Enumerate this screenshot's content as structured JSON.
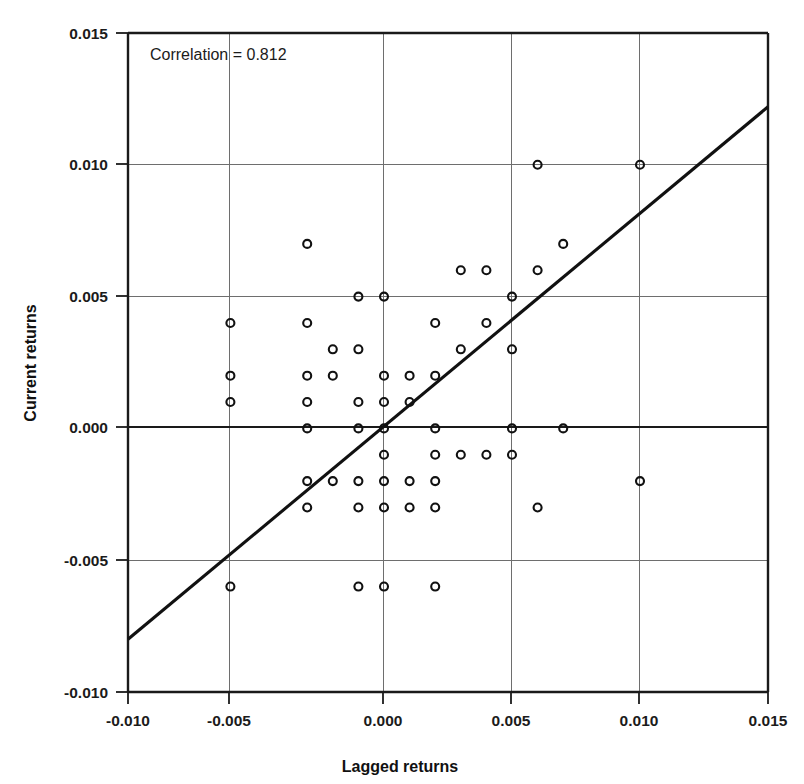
{
  "chart_data": {
    "type": "scatter",
    "title": "",
    "xlabel": "Lagged returns",
    "ylabel": "Current returns",
    "xlim": [
      -0.01,
      0.015
    ],
    "ylim": [
      -0.01,
      0.015
    ],
    "xticks": [
      "-0.010",
      "-0.005",
      "0.000",
      "0.005",
      "0.010",
      "0.015"
    ],
    "xtick_values": [
      -0.01,
      -0.005,
      0.0,
      0.005,
      0.01,
      0.015
    ],
    "yticks": [
      "-0.010",
      "-0.005",
      "0.000",
      "0.005",
      "0.010",
      "0.015"
    ],
    "ytick_values": [
      -0.01,
      -0.005,
      0.0,
      0.005,
      0.01,
      0.015
    ],
    "grid": true,
    "legend_position": "none",
    "annotations": [
      {
        "name": "correlation-label",
        "text": "Correlation = 0.812",
        "x": -0.0085,
        "y": 0.0139
      }
    ],
    "series": [
      {
        "name": "returns-scatter",
        "marker": "open-circle",
        "marker_color": "#111111",
        "points": [
          [
            -0.006,
            0.004
          ],
          [
            -0.006,
            0.002
          ],
          [
            -0.006,
            0.001
          ],
          [
            -0.006,
            -0.006
          ],
          [
            -0.003,
            0.007
          ],
          [
            -0.003,
            0.004
          ],
          [
            -0.003,
            0.002
          ],
          [
            -0.003,
            0.001
          ],
          [
            -0.003,
            0.0
          ],
          [
            -0.003,
            -0.002
          ],
          [
            -0.003,
            -0.003
          ],
          [
            -0.002,
            0.003
          ],
          [
            -0.002,
            0.002
          ],
          [
            -0.002,
            -0.002
          ],
          [
            -0.001,
            0.005
          ],
          [
            -0.001,
            0.003
          ],
          [
            -0.001,
            0.001
          ],
          [
            -0.001,
            0.0
          ],
          [
            -0.001,
            -0.002
          ],
          [
            -0.001,
            -0.003
          ],
          [
            -0.001,
            -0.006
          ],
          [
            0.0,
            0.005
          ],
          [
            0.0,
            0.002
          ],
          [
            0.0,
            0.001
          ],
          [
            0.0,
            0.0
          ],
          [
            0.0,
            -0.001
          ],
          [
            0.0,
            -0.002
          ],
          [
            0.0,
            -0.003
          ],
          [
            0.0,
            -0.006
          ],
          [
            0.001,
            0.002
          ],
          [
            0.001,
            0.001
          ],
          [
            0.001,
            -0.002
          ],
          [
            0.001,
            -0.003
          ],
          [
            0.002,
            0.004
          ],
          [
            0.002,
            0.002
          ],
          [
            0.002,
            0.0
          ],
          [
            0.002,
            -0.001
          ],
          [
            0.002,
            -0.002
          ],
          [
            0.002,
            -0.003
          ],
          [
            0.002,
            -0.006
          ],
          [
            0.003,
            0.006
          ],
          [
            0.003,
            0.003
          ],
          [
            0.003,
            -0.001
          ],
          [
            0.004,
            0.006
          ],
          [
            0.004,
            0.004
          ],
          [
            0.004,
            -0.001
          ],
          [
            0.005,
            0.005
          ],
          [
            0.005,
            0.003
          ],
          [
            0.005,
            0.0
          ],
          [
            0.005,
            -0.001
          ],
          [
            0.006,
            0.01
          ],
          [
            0.006,
            0.006
          ],
          [
            0.006,
            -0.003
          ],
          [
            0.007,
            0.007
          ],
          [
            0.007,
            0.0
          ],
          [
            0.01,
            0.01
          ],
          [
            0.01,
            -0.002
          ]
        ]
      }
    ],
    "trend_line": {
      "name": "regression-line",
      "color": "#111111",
      "x_start": -0.01,
      "y_start": -0.008,
      "x_end": 0.015,
      "y_end": 0.0122
    }
  }
}
